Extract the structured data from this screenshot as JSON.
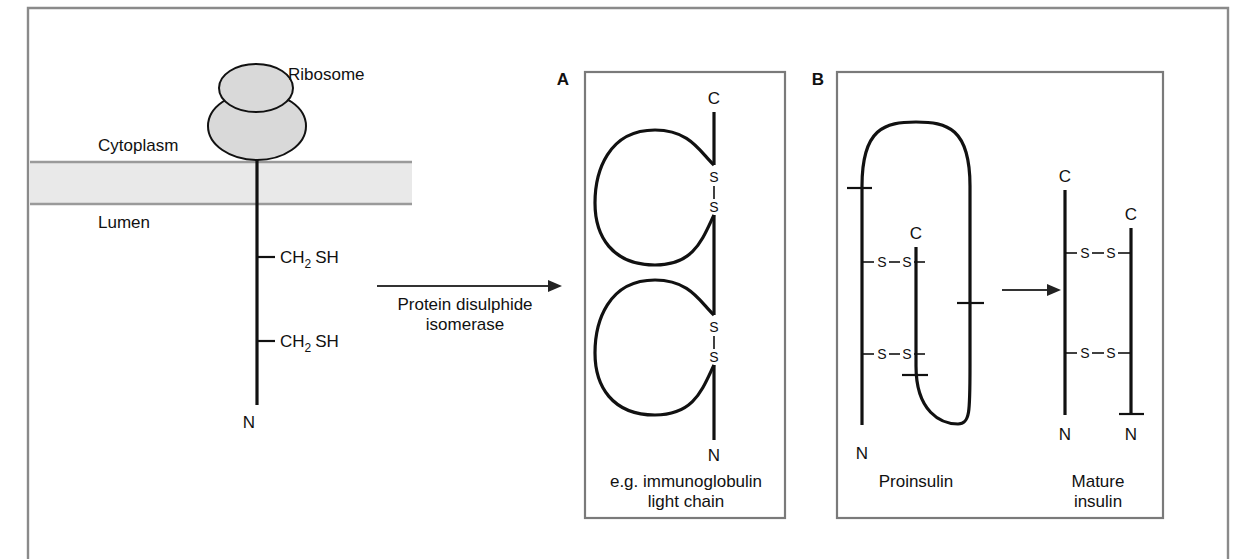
{
  "figure": {
    "background": "#ffffff",
    "line_color": "#111111",
    "membrane_fill": "#e9e9e9",
    "ribosome_fill": "#d9d9d9",
    "frame_color": "#8a8a8a"
  },
  "left_panel": {
    "ribosome_label": "Ribosome",
    "cytoplasm_label": "Cytoplasm",
    "lumen_label": "Lumen",
    "side_chain_upper": {
      "prefix": "CH",
      "subscript": "2",
      "suffix": "SH"
    },
    "side_chain_lower": {
      "prefix": "CH",
      "subscript": "2",
      "suffix": "SH"
    },
    "n_terminus": "N"
  },
  "reaction_arrow": {
    "label_line1": "Protein disulphide",
    "label_line2": "isomerase"
  },
  "panel_a": {
    "letter": "A",
    "c_terminus": "C",
    "n_terminus": "N",
    "bond_upper": {
      "s1": "S",
      "s2": "S",
      "link": "|"
    },
    "bond_lower": {
      "s1": "S",
      "s2": "S",
      "link": "|"
    },
    "caption_line1": "e.g. immunoglobulin",
    "caption_line2": "light chain"
  },
  "panel_b": {
    "letter": "B",
    "proinsulin": {
      "caption": "Proinsulin",
      "n_terminus": "N",
      "c_terminus": "C",
      "bond_upper": "S—S",
      "bond_lower": "S—S",
      "bond_upper_s1": "S",
      "bond_upper_s2": "S",
      "bond_lower_s1": "S",
      "bond_lower_s2": "S"
    },
    "mature_insulin": {
      "caption_line1": "Mature",
      "caption_line2": "insulin",
      "chain_a_c": "C",
      "chain_a_n": "N",
      "chain_b_c": "C",
      "chain_b_n": "N",
      "bond_upper_s1": "S",
      "bond_upper_s2": "S",
      "bond_lower_s1": "S",
      "bond_lower_s2": "S"
    }
  }
}
